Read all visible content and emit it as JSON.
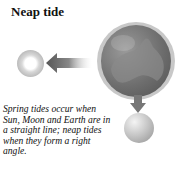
{
  "title": "Neap tide",
  "caption": "Spring tides occur when Sun, Moon and Earth are in a straight line; neap tides when they form a right angle.",
  "icons": {
    "moon_left": "moon-icon",
    "arrow_left": "arrow-left-icon",
    "earth": "earth-icon",
    "arrow_down": "arrow-down-icon",
    "moon_bottom": "moon-icon"
  }
}
